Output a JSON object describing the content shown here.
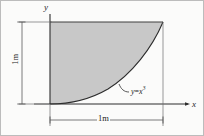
{
  "figure": {
    "kind": "math-region-diagram",
    "background_color": "#fbfbfa",
    "border_color": "#b9b9b9",
    "shaded_region_color": "#c8c8c8",
    "line_color": "#3a3a3a",
    "dimension_line_color": "#5a5a5a"
  },
  "axes": {
    "y_label": "y",
    "x_label": "x",
    "y_axis": {
      "x": 50,
      "top": 14,
      "bottom": 104
    },
    "x_axis": {
      "y": 104,
      "left": 34,
      "right": 190
    }
  },
  "curve": {
    "equation_text": "y",
    "equation_operator": "=",
    "equation_base": "x",
    "equation_exponent": "3",
    "equation_full": "y = x^3",
    "origin": {
      "x": 50,
      "y": 104
    },
    "end": {
      "x": 163,
      "y": 22
    }
  },
  "dimensions": {
    "vertical": {
      "label": "1m",
      "value": 1,
      "unit": "m",
      "line_x": 22,
      "from_y": 22,
      "to_y": 104
    },
    "horizontal": {
      "label": "1m",
      "value": 1,
      "unit": "m",
      "line_y": 120,
      "from_x": 50,
      "to_x": 163
    }
  },
  "region": {
    "left": 50,
    "top": 22,
    "right": 163,
    "bottom": 104
  }
}
